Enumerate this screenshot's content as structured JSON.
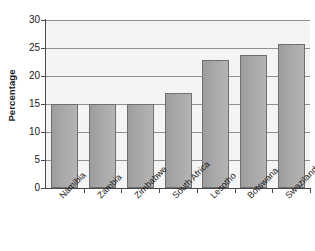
{
  "chart_data": {
    "type": "bar",
    "title": "",
    "subtitle": "",
    "xlabel": "",
    "ylabel": "Percentage",
    "categories": [
      "Namibia",
      "Zambia",
      "Zimbabwe",
      "South Africa",
      "Lesotho",
      "Botswana",
      "Swaziland"
    ],
    "values": [
      15.0,
      15.0,
      15.0,
      17.0,
      22.9,
      23.8,
      25.8
    ],
    "ylim": [
      0,
      30
    ],
    "ytick_labels": [
      "0",
      "5",
      "10",
      "15",
      "20",
      "25",
      "30"
    ],
    "yticks": [
      0,
      5,
      10,
      15,
      20,
      25,
      30
    ],
    "grid": true,
    "grid_axis": "y",
    "legend": "none",
    "annotations": [],
    "colors": {
      "bar_fill": "#a8a8a8",
      "bar_edge": "#6f6f6f",
      "plot_background": "#f4f4f4",
      "gridline": "#8f8f8f",
      "axis": "#4a4a4a",
      "text": "#1a1a1a",
      "figure_background": "#ffffff"
    }
  }
}
